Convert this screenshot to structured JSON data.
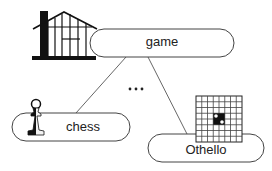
{
  "diagram": {
    "root": {
      "label": "game",
      "icon": "house-frame-icon"
    },
    "children": [
      {
        "label": "chess",
        "icon": "chess-pawn-icon"
      },
      {
        "label": "Othello",
        "icon": "othello-board-icon"
      }
    ],
    "ellipsis": "…"
  },
  "colors": {
    "stroke": "#444444",
    "fill": "#ffffff",
    "text": "#222222",
    "icon": "#111111"
  }
}
